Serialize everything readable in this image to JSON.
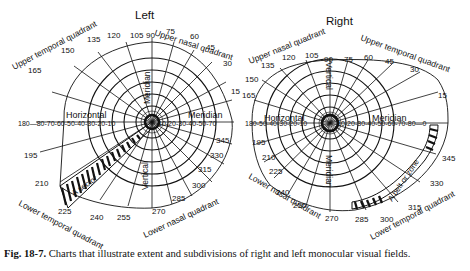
{
  "figure": {
    "caption_label": "Fig. 18-7.",
    "caption_text": " Charts that illustrate extent and subdivisions of right and left monocular visual fields."
  },
  "left_chart": {
    "title": "Left",
    "center": [
      152,
      122
    ],
    "quadrants": {
      "upper_temporal": "Upper temporal quadrant",
      "upper_nasal": "Upper nasal quadrant",
      "lower_temporal": "Lower temporal quadrant",
      "lower_nasal": "Lower nasal quadrant"
    },
    "meridian_labels": {
      "horizontal": "Horizontal",
      "meridian_right": "Meridian",
      "meridian_vertical": "Meridian",
      "vertical": "Vertical"
    },
    "sector_label": "A sector",
    "angles": [
      "90",
      "75",
      "60",
      "45",
      "30",
      "15",
      "0",
      "345",
      "330",
      "315",
      "300",
      "285",
      "270",
      "255",
      "240",
      "225",
      "210",
      "195",
      "180",
      "165",
      "150",
      "135",
      "120",
      "105"
    ],
    "left_ticks": "180—80-70-60-50-40-30-20-10",
    "right_ticks": "10-20-30-40-50-70"
  },
  "right_chart": {
    "title": "Right",
    "center": [
      330,
      123
    ],
    "quadrants": {
      "upper_nasal": "Upper nasal quadrant",
      "upper_temporal": "Upper temporal quadrant",
      "lower_nasal": "Lower nasal quadrant",
      "lower_temporal": "Lower temporal quadrant"
    },
    "meridian_labels": {
      "horizontal": "Horizontal",
      "meridian_right": "Meridian",
      "vertical": "Vertical",
      "meridian_vertical": "Meridian"
    },
    "zone_label": "A belt or zone",
    "left_ticks": "180-50-40-30-20-10",
    "right_ticks": "10-20-30-40-50-60-70-80—0"
  }
}
